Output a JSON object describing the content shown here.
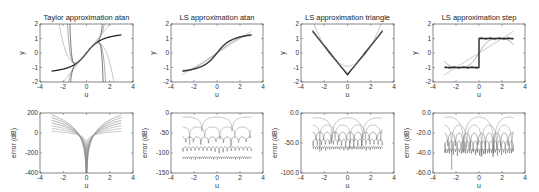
{
  "chart_data": [
    {
      "type": "line",
      "title": "Taylor approximation atan",
      "xlabel": "u",
      "ylabel": "y",
      "xlim": [
        -4,
        4
      ],
      "ylim": [
        -2,
        2
      ],
      "xticks": [
        "-4",
        "-2",
        "0",
        "2",
        "4"
      ],
      "yticks": [
        "2",
        "1",
        "0",
        "-1",
        "-2"
      ],
      "kind": "taylor_atan"
    },
    {
      "type": "line",
      "title": "LS approximation atan",
      "xlabel": "u",
      "ylabel": "y",
      "xlim": [
        -4,
        4
      ],
      "ylim": [
        -2,
        2
      ],
      "xticks": [
        "-4",
        "-2",
        "0",
        "2",
        "4"
      ],
      "yticks": [
        "2",
        "1",
        "0",
        "-1",
        "-2"
      ],
      "kind": "ls_atan"
    },
    {
      "type": "line",
      "title": "LS approximation triangle",
      "xlabel": "u",
      "ylabel": "y",
      "xlim": [
        -4,
        4
      ],
      "ylim": [
        -2,
        2
      ],
      "xticks": [
        "-4",
        "-2",
        "0",
        "2",
        "4"
      ],
      "yticks": [
        "2",
        "1",
        "0",
        "-1",
        "-2"
      ],
      "kind": "ls_tri"
    },
    {
      "type": "line",
      "title": "LS approximation step",
      "xlabel": "u",
      "ylabel": "y",
      "xlim": [
        -4,
        4
      ],
      "ylim": [
        -2,
        2
      ],
      "xticks": [
        "-4",
        "-2",
        "0",
        "2",
        "4"
      ],
      "yticks": [
        "2",
        "1",
        "0",
        "-1",
        "-2"
      ],
      "kind": "ls_step"
    },
    {
      "type": "line",
      "title": "",
      "xlabel": "u",
      "ylabel": "error (dB)",
      "xlim": [
        -4,
        4
      ],
      "ylim": [
        -400,
        200
      ],
      "xticks": [
        "-4",
        "-2",
        "0",
        "2",
        "4"
      ],
      "yticks": [
        "200",
        "0",
        "-200",
        "-400"
      ],
      "kind": "err_taylor"
    },
    {
      "type": "line",
      "title": "",
      "xlabel": "u",
      "ylabel": "error (dB)",
      "xlim": [
        -4,
        4
      ],
      "ylim": [
        -150,
        0
      ],
      "xticks": [
        "-4",
        "-2",
        "0",
        "2",
        "4"
      ],
      "yticks": [
        "0",
        "-50",
        "-100",
        "-150"
      ],
      "kind": "err_atan"
    },
    {
      "type": "line",
      "title": "",
      "xlabel": "u",
      "ylabel": "error (dB)",
      "xlim": [
        -4,
        4
      ],
      "ylim": [
        -100,
        0
      ],
      "xticks": [
        "-4",
        "-2",
        "0",
        "2",
        "4"
      ],
      "yticks": [
        "0.0",
        "-50.0",
        "-100.0"
      ],
      "kind": "err_tri"
    },
    {
      "type": "line",
      "title": "",
      "xlabel": "u",
      "ylabel": "error (dB)",
      "xlim": [
        -4,
        4
      ],
      "ylim": [
        -60,
        0
      ],
      "xticks": [
        "-4",
        "-2",
        "0",
        "2",
        "4"
      ],
      "yticks": [
        "0.0",
        "-20.0",
        "-40.0",
        "-60.0"
      ],
      "kind": "err_step"
    }
  ],
  "layout": {
    "cols_x": [
      [
        40,
        133
      ],
      [
        171,
        263
      ],
      [
        301,
        394
      ],
      [
        433,
        525
      ]
    ],
    "rows_y": [
      [
        24,
        82
      ],
      [
        113,
        173
      ]
    ]
  }
}
